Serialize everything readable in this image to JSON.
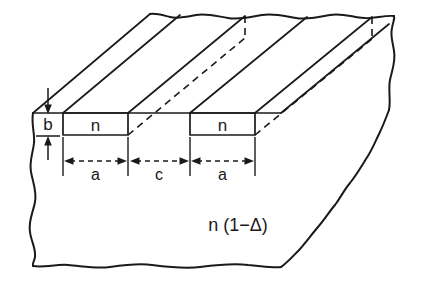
{
  "figure": {
    "background_color": "#ffffff",
    "line_color": "#1a1a1a",
    "labels": {
      "core_index_1": "n",
      "core_index_2": "n",
      "cladding_index": "n (1−Δ)",
      "thickness": "b",
      "stripe_width_1": "a",
      "stripe_gap": "c",
      "stripe_width_2": "a"
    },
    "dimensions": [
      {
        "name": "thickness",
        "symbol": "b",
        "orientation": "vertical"
      },
      {
        "name": "stripe-width-left",
        "symbol": "a",
        "orientation": "horizontal"
      },
      {
        "name": "stripe-gap",
        "symbol": "c",
        "orientation": "horizontal"
      },
      {
        "name": "stripe-width-right",
        "symbol": "a",
        "orientation": "horizontal"
      }
    ]
  }
}
